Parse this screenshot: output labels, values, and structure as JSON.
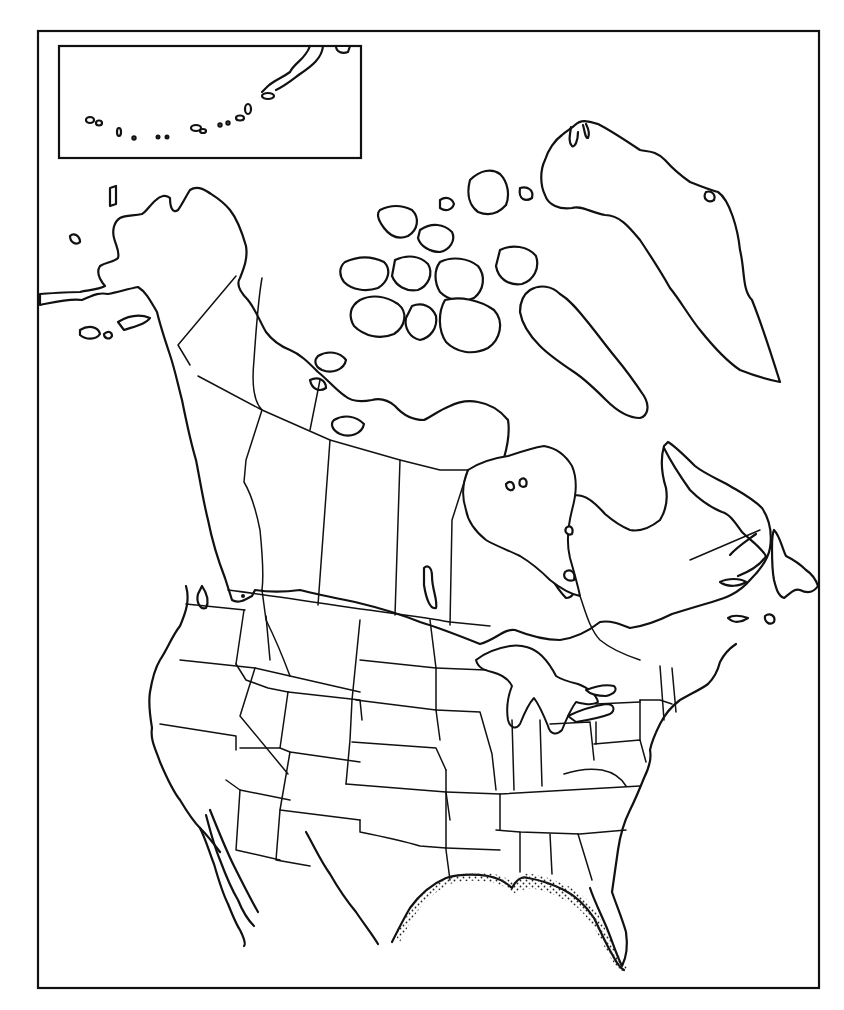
{
  "map": {
    "title": "",
    "type": "outline map",
    "region": "North America",
    "style": "black outline on white, no labels",
    "frame": {
      "x": 38,
      "y": 30,
      "width": 782,
      "height": 958,
      "stroke": "#111111"
    },
    "inset": {
      "name": "Aleutian Islands inset",
      "x": 58,
      "y": 44,
      "width": 302,
      "height": 114
    },
    "features": [
      "Alaska",
      "Canadian provinces and territories",
      "Canadian Arctic Archipelago",
      "Greenland",
      "Hudson Bay",
      "Great Lakes",
      "Contiguous United States state boundaries",
      "Baja California / northern Mexico",
      "Newfoundland"
    ],
    "highlighted_range": {
      "description": "stippled band along Gulf of Mexico coast (Texas to Florida)",
      "pattern": "dots"
    },
    "colors": {
      "line": "#111111",
      "background": "#ffffff"
    }
  }
}
